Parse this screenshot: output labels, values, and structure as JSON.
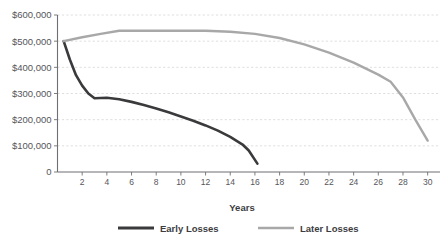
{
  "chart_data": {
    "type": "line",
    "title": "",
    "xlabel": "Years",
    "ylabel": "",
    "xlim": [
      0,
      31
    ],
    "ylim": [
      0,
      600000
    ],
    "grid": true,
    "legend_position": "bottom",
    "x_tick_labels": [
      "2",
      "4",
      "6",
      "8",
      "10",
      "12",
      "14",
      "16",
      "18",
      "20",
      "22",
      "24",
      "26",
      "28",
      "30"
    ],
    "x_tick_values": [
      2,
      4,
      6,
      8,
      10,
      12,
      14,
      16,
      18,
      20,
      22,
      24,
      26,
      28,
      30
    ],
    "y_tick_labels": [
      "$600,000",
      "$500,000",
      "$400,000",
      "$300,000",
      "$200,000",
      "$100,000",
      "0"
    ],
    "y_tick_values": [
      600000,
      500000,
      400000,
      300000,
      200000,
      100000,
      0
    ],
    "series": [
      {
        "name": "Early Losses",
        "color": "#3a3a3c",
        "x": [
          0.5,
          1,
          1.5,
          2,
          2.5,
          3,
          3.5,
          4,
          5,
          6,
          7,
          8,
          9,
          10,
          11,
          12,
          13,
          14,
          15,
          15.5,
          16.2
        ],
        "values": [
          500000,
          430000,
          370000,
          330000,
          300000,
          282000,
          283000,
          284000,
          278000,
          268000,
          256000,
          243000,
          228000,
          212000,
          196000,
          178000,
          158000,
          134000,
          105000,
          82000,
          32000
        ]
      },
      {
        "name": "Later Losses",
        "color": "#a8a8a8",
        "x": [
          0.5,
          2,
          3.5,
          5,
          6,
          8,
          10,
          12,
          14,
          16,
          18,
          20,
          22,
          24,
          26,
          27,
          28,
          29,
          30
        ],
        "values": [
          500000,
          515000,
          528000,
          540000,
          540000,
          540000,
          540000,
          540000,
          536000,
          528000,
          512000,
          488000,
          456000,
          418000,
          372000,
          345000,
          285000,
          200000,
          120000
        ]
      }
    ]
  },
  "legend": {
    "items": [
      {
        "label": "Early Losses",
        "color": "#3a3a3c"
      },
      {
        "label": "Later Losses",
        "color": "#a8a8a8"
      }
    ]
  },
  "axis": {
    "x_title": "Years"
  },
  "colors": {
    "early_losses": "#3a3a3c",
    "later_losses": "#a8a8a8",
    "gridline": "#d6d6d6",
    "axis": "#6f6f73",
    "text": "#56565a",
    "background": "#ffffff"
  }
}
